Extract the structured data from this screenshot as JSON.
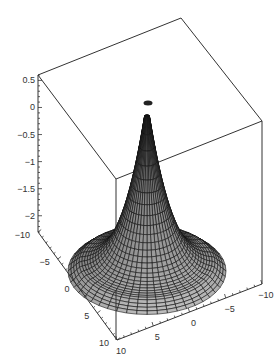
{
  "chart_data": {
    "type": "surface3d",
    "title": "",
    "title_faded_text_present": true,
    "x_axis": {
      "label": "",
      "range": [
        -10,
        10
      ],
      "ticks": [
        -10,
        -5,
        0,
        5,
        10
      ]
    },
    "y_axis": {
      "label": "",
      "range": [
        -10,
        10
      ],
      "ticks": [
        10,
        5,
        0,
        -5,
        -10
      ]
    },
    "z_axis": {
      "label": "",
      "range": [
        -2.3,
        0.6
      ],
      "ticks": [
        0.5,
        0,
        -0.5,
        -1,
        -1.5,
        -2
      ]
    },
    "surface": {
      "shape": "radial cusp / bell",
      "peak_z": 0.5,
      "base_z": -2.3,
      "grid": "polar mesh",
      "fill_color": "#b4b4b4",
      "line_color": "#111111",
      "shading": "gray, darker toward peak"
    },
    "frame": {
      "box": true,
      "grid": false,
      "legend": false
    }
  },
  "z_tick_labels": [
    "0.5",
    "0",
    "−0.5",
    "−1",
    "−1.5",
    "−2"
  ],
  "left_axis_tick_labels": [
    "−10",
    "−5",
    "0",
    "5",
    "10"
  ],
  "right_axis_tick_labels": [
    "10",
    "5",
    "0",
    "−5",
    "−10"
  ]
}
